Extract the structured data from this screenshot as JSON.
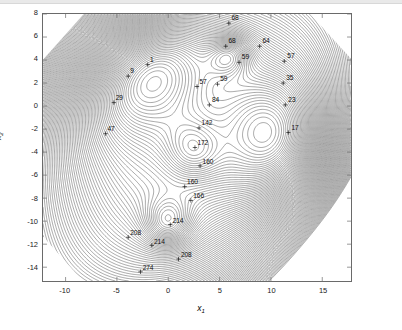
{
  "figure": {
    "type": "contour-plot",
    "background": "#ffffff",
    "frame_color": "#6a6a6a"
  },
  "axes": {
    "x": {
      "title": "x",
      "subscript": "1",
      "min": -12.2,
      "max": 17.8,
      "ticks": [
        -10,
        -5,
        0,
        5,
        10,
        15
      ],
      "tick_labels": [
        "-10",
        "-5",
        "0",
        "5",
        "10",
        "15"
      ]
    },
    "y": {
      "title": "x",
      "subscript": "2",
      "min": -15.2,
      "max": 8.0,
      "ticks": [
        8,
        6,
        4,
        2,
        0,
        -2,
        -4,
        -6,
        -8,
        -10,
        -12,
        -14
      ],
      "tick_labels": [
        "8",
        "6",
        "4",
        "2",
        "0",
        "-2",
        "-4",
        "-6",
        "-8",
        "-10",
        "-12",
        "-14"
      ]
    }
  },
  "chart_data": {
    "type": "line",
    "title": "",
    "xlabel": "x_1",
    "ylabel": "x_2",
    "xlim": [
      -12.2,
      17.8
    ],
    "ylim": [
      -15.2,
      8.0
    ],
    "grid": false,
    "legend": "none",
    "plot_style": "contour lines, unfilled, thin gray-black strokes on white, clipped to an octagonal data region",
    "contour_levels": [
      1,
      9,
      17,
      23,
      29,
      35,
      47,
      57,
      59,
      64,
      68,
      84,
      142,
      160,
      166,
      172,
      208,
      214,
      274,
      288
    ],
    "labeled_contours": [
      {
        "label": "1",
        "value": 1,
        "x": -2.0,
        "y": 3.6
      },
      {
        "label": "9",
        "value": 9,
        "x": -3.9,
        "y": 2.6
      },
      {
        "label": "29",
        "value": 29,
        "x": -5.3,
        "y": 0.3
      },
      {
        "label": "47",
        "value": 47,
        "x": -6.1,
        "y": -2.4
      },
      {
        "label": "57",
        "value": 57,
        "x": 2.8,
        "y": 1.7
      },
      {
        "label": "59",
        "value": 59,
        "x": 4.8,
        "y": 1.9
      },
      {
        "label": "68",
        "value": 68,
        "x": 5.9,
        "y": 7.2
      },
      {
        "label": "68",
        "value": 68,
        "x": 5.6,
        "y": 5.2
      },
      {
        "label": "64",
        "value": 64,
        "x": 8.9,
        "y": 5.2
      },
      {
        "label": "59",
        "value": 59,
        "x": 6.9,
        "y": 3.8
      },
      {
        "label": "57",
        "value": 57,
        "x": 11.3,
        "y": 3.9
      },
      {
        "label": "35",
        "value": 35,
        "x": 11.2,
        "y": 2.0
      },
      {
        "label": "23",
        "value": 23,
        "x": 11.4,
        "y": 0.1
      },
      {
        "label": "17",
        "value": 17,
        "x": 11.7,
        "y": -2.3
      },
      {
        "label": "84",
        "value": 84,
        "x": 4.0,
        "y": 0.1
      },
      {
        "label": "142",
        "value": 142,
        "x": 3.0,
        "y": -1.9
      },
      {
        "label": "172",
        "value": 172,
        "x": 2.6,
        "y": -3.6
      },
      {
        "label": "160",
        "value": 160,
        "x": 3.1,
        "y": -5.2
      },
      {
        "label": "160",
        "value": 160,
        "x": 1.6,
        "y": -7.0
      },
      {
        "label": "166",
        "value": 166,
        "x": 2.2,
        "y": -8.2
      },
      {
        "label": "214",
        "value": 214,
        "x": 0.2,
        "y": -10.3
      },
      {
        "label": "208",
        "value": 208,
        "x": -3.9,
        "y": -11.4
      },
      {
        "label": "214",
        "value": 214,
        "x": -1.6,
        "y": -12.1
      },
      {
        "label": "208",
        "value": 208,
        "x": 1.0,
        "y": -13.3
      },
      {
        "label": "274",
        "value": 274,
        "x": -2.7,
        "y": -14.4
      }
    ],
    "minima": [
      {
        "x": -1.8,
        "y": 3.3,
        "approx_value": 1
      },
      {
        "x": 10.8,
        "y": -2.9,
        "approx_value": 17
      },
      {
        "x": 6.0,
        "y": 4.4,
        "approx_value": 68
      },
      {
        "x": 2.4,
        "y": -3.8,
        "approx_value": 172
      },
      {
        "x": 0.0,
        "y": -10.2,
        "approx_value": 214
      }
    ]
  }
}
